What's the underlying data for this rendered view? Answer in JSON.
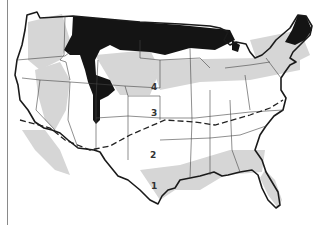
{
  "map": {
    "title": "",
    "subject": "United States zone map",
    "zones": [
      {
        "label": "1",
        "x": 154,
        "y": 186
      },
      {
        "label": "2",
        "x": 153,
        "y": 155
      },
      {
        "label": "3",
        "x": 154,
        "y": 113
      },
      {
        "label": "4",
        "x": 154,
        "y": 87
      }
    ],
    "colors": {
      "outline": "#1a1a1a",
      "dark_zone": "#141414",
      "light_zone": "#d2d2d2",
      "background": "#ffffff"
    }
  }
}
